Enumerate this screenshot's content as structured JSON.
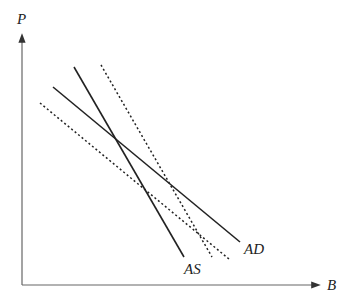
{
  "diagram": {
    "type": "AS-AD diagram",
    "axes": {
      "y_label": "P",
      "x_label": "B"
    },
    "curves": [
      {
        "id": "AS",
        "label": "AS",
        "style": "solid",
        "slope": "steep-negative"
      },
      {
        "id": "AD",
        "label": "AD",
        "style": "solid",
        "slope": "negative"
      },
      {
        "id": "AS-shifted",
        "label": "",
        "style": "dotted",
        "slope": "steep-negative"
      },
      {
        "id": "AD-shifted",
        "label": "",
        "style": "dotted",
        "slope": "negative"
      }
    ]
  }
}
